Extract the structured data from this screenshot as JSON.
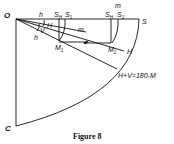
{
  "figure": {
    "caption": "Figure 8",
    "labels": {
      "origin": "O",
      "bottom": "C",
      "right_top": "S",
      "right_arc": "H",
      "h_top": "h",
      "h_lower": "h",
      "H_small": "H",
      "V_small": "V",
      "m_mid": "m",
      "m_top": "m",
      "S_H1": "S",
      "S_H1_sub": "H",
      "S_1": "S",
      "S_1_sub": "1",
      "S_H2": "S",
      "S_H2_sub": "H",
      "S_2": "S",
      "S_2_sub": "1",
      "M1": "M",
      "M1_sub": "1",
      "M2": "M",
      "M2_sub": "2",
      "equation": "H+V=180-M"
    }
  }
}
